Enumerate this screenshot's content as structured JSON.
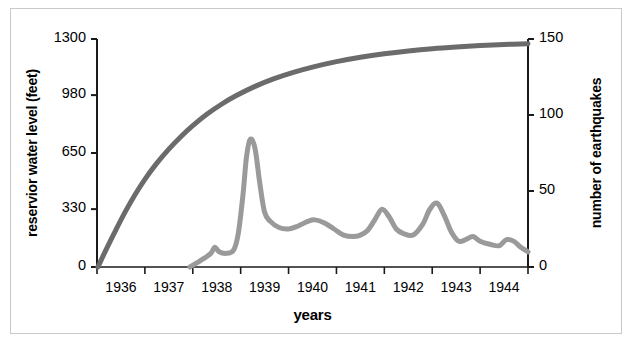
{
  "chart_data": {
    "type": "line",
    "title": "",
    "xlabel": "years",
    "ylabel_left": "reservior water level (feet)",
    "ylabel_right": "number of earthquakes",
    "x_tick_labels": [
      "1936",
      "1937",
      "1938",
      "1939",
      "1940",
      "1941",
      "1942",
      "1943",
      "1944"
    ],
    "x_tick_values": [
      1936,
      1937,
      1938,
      1939,
      1940,
      1941,
      1942,
      1943,
      1944
    ],
    "xlim": [
      1935.5,
      1944.5
    ],
    "y_left_ticks": [
      0,
      330,
      650,
      980,
      1300
    ],
    "y_left_tick_labels": [
      "0",
      "330",
      "650",
      "980",
      "1300"
    ],
    "ylim_left": [
      0,
      1300
    ],
    "y_right_ticks": [
      0,
      50,
      100,
      150
    ],
    "y_right_tick_labels": [
      "0",
      "50",
      "100",
      "150"
    ],
    "ylim_right": [
      0,
      150
    ],
    "grid": false,
    "legend_position": "none",
    "series": [
      {
        "name": "reservoir water level",
        "axis": "left",
        "units": "feet",
        "color": "#6b6b6b",
        "linewidth": 5,
        "x": [
          1935.52,
          1935.7,
          1935.9,
          1936.1,
          1936.3,
          1936.5,
          1936.75,
          1937.0,
          1937.25,
          1937.5,
          1937.8,
          1938.1,
          1938.4,
          1938.8,
          1939.2,
          1939.6,
          1940.0,
          1940.5,
          1941.0,
          1941.5,
          1942.0,
          1942.5,
          1943.0,
          1943.5,
          1944.0,
          1944.5
        ],
        "values": [
          0,
          105,
          215,
          320,
          415,
          500,
          592,
          672,
          743,
          806,
          872,
          928,
          976,
          1030,
          1074,
          1110,
          1140,
          1171,
          1196,
          1216,
          1232,
          1245,
          1255,
          1263,
          1269,
          1273
        ]
      },
      {
        "name": "number of earthquakes",
        "axis": "right",
        "units": "count",
        "color": "#9a9a9a",
        "linewidth": 5,
        "x": [
          1937.44,
          1937.6,
          1937.75,
          1937.88,
          1937.96,
          1938.05,
          1938.2,
          1938.35,
          1938.45,
          1938.55,
          1938.62,
          1938.7,
          1938.8,
          1938.9,
          1939.0,
          1939.12,
          1939.3,
          1939.5,
          1939.7,
          1939.9,
          1940.05,
          1940.25,
          1940.45,
          1940.65,
          1940.85,
          1941.0,
          1941.15,
          1941.3,
          1941.45,
          1941.6,
          1941.75,
          1941.9,
          1942.1,
          1942.3,
          1942.45,
          1942.6,
          1942.75,
          1942.9,
          1943.05,
          1943.2,
          1943.35,
          1943.5,
          1943.7,
          1943.9,
          1944.05,
          1944.2,
          1944.35,
          1944.5
        ],
        "values": [
          0,
          3,
          6,
          9,
          13,
          10,
          9,
          11,
          22,
          48,
          72,
          84,
          78,
          55,
          36,
          30,
          26,
          25,
          27,
          30,
          31,
          29,
          25,
          21,
          20,
          21,
          24,
          31,
          38,
          33,
          25,
          22,
          21,
          28,
          38,
          42,
          34,
          23,
          17,
          18,
          20,
          17,
          15,
          14,
          18,
          17,
          13,
          10
        ]
      }
    ],
    "annotations": []
  },
  "colors": {
    "water_level_line": "#6b6b6b",
    "earthquake_line": "#9a9a9a",
    "axis": "#1a1a1a",
    "frame": "#c9c9c9",
    "background": "#ffffff"
  }
}
